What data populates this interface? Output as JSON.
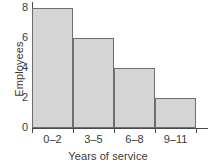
{
  "chart_data": {
    "type": "bar",
    "title": "",
    "subtitle": "",
    "categories": [
      "0–2",
      "3–5",
      "6–8",
      "9–11"
    ],
    "values": [
      8,
      6,
      4,
      2
    ],
    "xlabel": "Years of service",
    "ylabel": "Employees",
    "ylim": [
      0,
      8
    ],
    "yticks": [
      "0",
      "2",
      "4",
      "6",
      "8"
    ],
    "ytick_values": [
      0,
      2,
      4,
      6,
      8
    ],
    "xlim_categories": 4,
    "grid": false,
    "legend": null,
    "legend_position": "none",
    "bar_fill_color": "#d5d5d5",
    "bar_border_color": "#6e6e6e",
    "axis_color": "#4a4a4a",
    "text_color": "#3a3a3a",
    "background_color": "#ffffff",
    "bar_gap": 0,
    "annotations": []
  }
}
